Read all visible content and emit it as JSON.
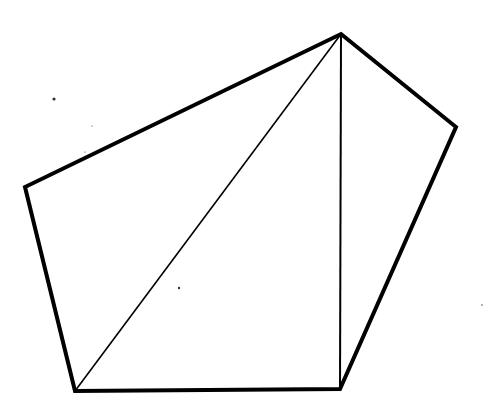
{
  "diagram": {
    "type": "geometric-figure",
    "stroke_color": "#000000",
    "background": "#ffffff",
    "vertices": {
      "top": [
        341,
        34
      ],
      "right": [
        456,
        127
      ],
      "bottom_right": [
        340,
        389
      ],
      "bottom_left": [
        75,
        391
      ],
      "left": [
        25,
        187
      ]
    },
    "outline": [
      "top",
      "right",
      "bottom_right",
      "bottom_left",
      "left"
    ],
    "outline_width": 4,
    "diagonals": [
      {
        "from": "top",
        "to": "bottom_left",
        "width": 1.6
      },
      {
        "from": "top",
        "to": "bottom_right",
        "width": 2
      }
    ],
    "specks": [
      {
        "x": 54,
        "y": 99,
        "r": 1.6
      },
      {
        "x": 179,
        "y": 288,
        "r": 1.2
      },
      {
        "x": 92,
        "y": 126,
        "r": 0.6
      },
      {
        "x": 85,
        "y": 152,
        "r": 0.6
      },
      {
        "x": 482,
        "y": 305,
        "r": 0.7
      }
    ]
  }
}
